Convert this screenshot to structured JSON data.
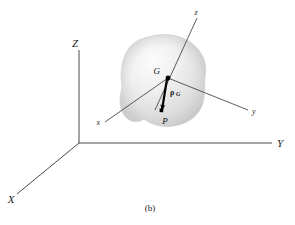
{
  "figure": {
    "caption": "(b)",
    "global_frame": {
      "name": "global-coordinate-frame",
      "axes": [
        {
          "id": "Z",
          "label": "Z",
          "description": "global vertical axis"
        },
        {
          "id": "Y",
          "label": "Y",
          "description": "global horizontal axis to the right"
        },
        {
          "id": "X",
          "label": "X",
          "description": "global axis toward lower left"
        }
      ]
    },
    "body_frame": {
      "name": "body-fixed-coordinate-frame",
      "origin_point": "G",
      "axes": [
        {
          "id": "z",
          "label": "z",
          "description": "body axis toward upper right"
        },
        {
          "id": "y",
          "label": "y",
          "description": "body axis toward lower right"
        },
        {
          "id": "x",
          "label": "x",
          "description": "body axis toward lower left"
        }
      ]
    },
    "points": [
      {
        "id": "G",
        "label": "G",
        "description": "center of mass"
      },
      {
        "id": "P",
        "label": "P",
        "description": "arbitrary point in the body"
      }
    ],
    "vector": {
      "name": "rho-G",
      "symbol": "ρ",
      "subscript": "G",
      "description": "position vector from P to G"
    },
    "body": {
      "name": "rigid-body-blob",
      "description": "shaded irregular rigid body"
    },
    "colors": {
      "background": "#ffffff",
      "axis_line": "#4a4a4a",
      "body_light": "#f2f2f2",
      "body_mid": "#e2e2e2",
      "body_dark": "#cfcfcf",
      "vector": "#000000",
      "text": "#101010"
    }
  }
}
